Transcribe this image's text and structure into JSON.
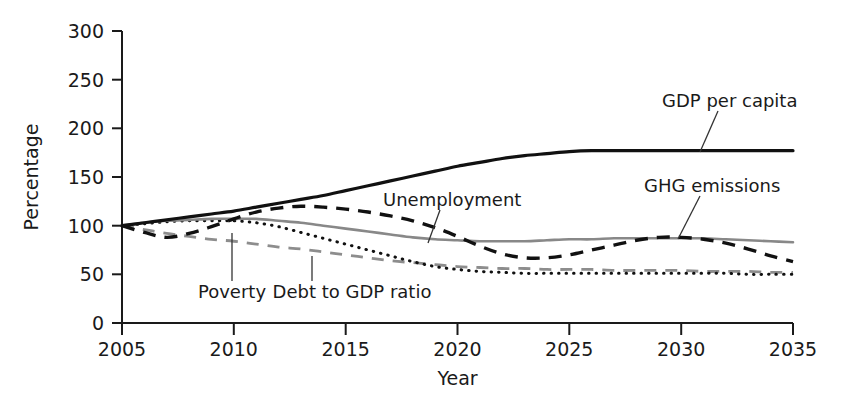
{
  "chart_data": {
    "type": "line",
    "title": "",
    "xlabel": "Year",
    "ylabel": "Percentage",
    "xlim": [
      2005,
      2035
    ],
    "ylim": [
      0,
      300
    ],
    "xticks": [
      2005,
      2010,
      2015,
      2020,
      2025,
      2030,
      2035
    ],
    "yticks": [
      0,
      50,
      100,
      150,
      200,
      250,
      300
    ],
    "grid": false,
    "legend_position": "inline-annotations",
    "x": [
      2005,
      2006,
      2007,
      2008,
      2009,
      2010,
      2011,
      2012,
      2013,
      2014,
      2015,
      2016,
      2017,
      2018,
      2019,
      2020,
      2021,
      2022,
      2023,
      2024,
      2025,
      2026,
      2027,
      2028,
      2029,
      2030,
      2031,
      2032,
      2033,
      2034,
      2035
    ],
    "series": [
      {
        "name": "GDP per capita",
        "style": "solid",
        "color": "#111111",
        "values": [
          100,
          103,
          106,
          109,
          112,
          115,
          119,
          123,
          127,
          131,
          136,
          141,
          146,
          151,
          156,
          161,
          165,
          169,
          172,
          174,
          176,
          177,
          177,
          177,
          177,
          177,
          177,
          177,
          177,
          177,
          177
        ]
      },
      {
        "name": "GHG emissions",
        "style": "solid",
        "color": "#888888",
        "values": [
          100,
          103,
          105,
          106,
          107,
          107,
          107,
          105,
          103,
          100,
          97,
          94,
          91,
          88,
          86,
          85,
          84,
          84,
          84,
          85,
          86,
          86,
          87,
          87,
          87,
          87,
          87,
          86,
          85,
          84,
          83
        ]
      },
      {
        "name": "Unemployment",
        "style": "dashed",
        "color": "#111111",
        "values": [
          100,
          93,
          88,
          92,
          99,
          107,
          114,
          118,
          120,
          119,
          117,
          114,
          110,
          105,
          98,
          89,
          79,
          71,
          67,
          67,
          70,
          75,
          80,
          85,
          88,
          88,
          86,
          82,
          76,
          69,
          63
        ]
      },
      {
        "name": "Poverty",
        "style": "dashed",
        "color": "#8d8d8d",
        "values": [
          100,
          96,
          92,
          89,
          86,
          84,
          81,
          78,
          76,
          73,
          70,
          67,
          64,
          62,
          60,
          58,
          57,
          56,
          56,
          55,
          55,
          55,
          54,
          54,
          54,
          54,
          53,
          53,
          53,
          52,
          52
        ]
      },
      {
        "name": "Debt to GDP ratio",
        "style": "dotted",
        "color": "#111111",
        "values": [
          100,
          102,
          104,
          105,
          105,
          105,
          103,
          99,
          93,
          87,
          81,
          75,
          69,
          63,
          58,
          55,
          53,
          52,
          51,
          51,
          51,
          51,
          51,
          51,
          51,
          51,
          51,
          51,
          50,
          50,
          50
        ]
      }
    ],
    "annotations": [
      {
        "text": "GDP per capita",
        "series": "GDP per capita"
      },
      {
        "text": "GHG emissions",
        "series": "GHG emissions"
      },
      {
        "text": "Unemployment",
        "series": "Unemployment"
      },
      {
        "text": "Poverty",
        "series": "Poverty"
      },
      {
        "text": "Debt to GDP ratio",
        "series": "Debt to GDP ratio"
      }
    ]
  },
  "axes": {
    "y_title": "Percentage",
    "x_title": "Year",
    "y_ticks": [
      "300",
      "250",
      "200",
      "150",
      "100",
      "50",
      "0"
    ],
    "x_ticks": [
      "2005",
      "2010",
      "2015",
      "2020",
      "2025",
      "2030",
      "2035"
    ]
  },
  "labels": {
    "gdp": "GDP per capita",
    "ghg": "GHG emissions",
    "unemployment": "Unemployment",
    "poverty": "Poverty",
    "debt": "Debt to GDP ratio"
  }
}
